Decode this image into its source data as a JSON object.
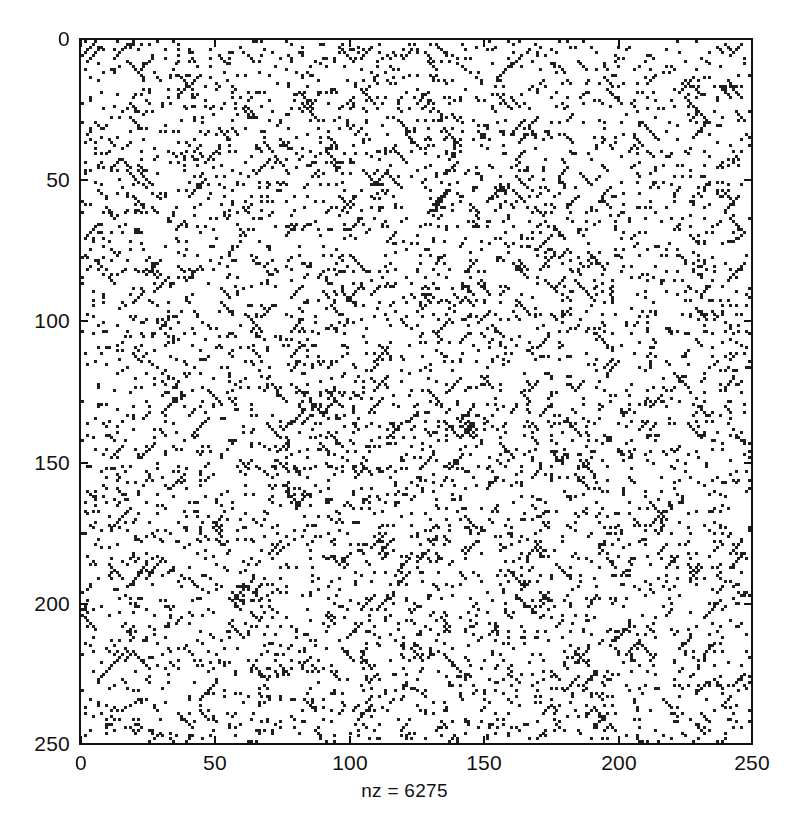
{
  "figure": {
    "title": "",
    "background_color": "#ffffff",
    "foreground_color": "#111111",
    "marker_color": "#1f1f1f"
  },
  "axis": {
    "x_ticks": [
      {
        "value": 0,
        "label": "0"
      },
      {
        "value": 50,
        "label": "50"
      },
      {
        "value": 100,
        "label": "100"
      },
      {
        "value": 150,
        "label": "150"
      },
      {
        "value": 200,
        "label": "200"
      },
      {
        "value": 250,
        "label": "250"
      }
    ],
    "y_ticks": [
      {
        "value": 0,
        "label": "0"
      },
      {
        "value": 50,
        "label": "50"
      },
      {
        "value": 100,
        "label": "100"
      },
      {
        "value": 150,
        "label": "150"
      },
      {
        "value": 200,
        "label": "200"
      },
      {
        "value": 250,
        "label": "250"
      }
    ],
    "xlabel": "nz = 6275",
    "ylabel": ""
  },
  "caption": {
    "nz_text": "nz = 6275"
  },
  "chart_data": {
    "type": "scatter",
    "subtype": "spy-sparsity-pattern",
    "title": "",
    "xlabel": "nz = 6275",
    "ylabel": "",
    "xlim": [
      0,
      250
    ],
    "ylim": [
      0,
      250
    ],
    "y_axis_inverted": true,
    "grid": false,
    "legend": null,
    "marker": "dot",
    "marker_size_px": 3,
    "marker_color": "#1f1f1f",
    "matrix_rows": 250,
    "matrix_cols": 250,
    "nonzeros": 6275,
    "density": 0.1004,
    "xtick_labels": [
      "0",
      "50",
      "100",
      "150",
      "200",
      "250"
    ],
    "ytick_labels": [
      "0",
      "50",
      "100",
      "150",
      "200",
      "250"
    ],
    "annotations": [
      "nz = 6275"
    ],
    "pattern_description": "Uniform random sparse scatter over a 250x250 grid with numerous short diagonal run segments of length 2-6 entries",
    "generation": {
      "seed": 20240517,
      "random_points": 4400,
      "diagonal_runs": 470,
      "run_length_min": 2,
      "run_length_max": 6,
      "antidiagonal_fraction": 0.45
    }
  }
}
